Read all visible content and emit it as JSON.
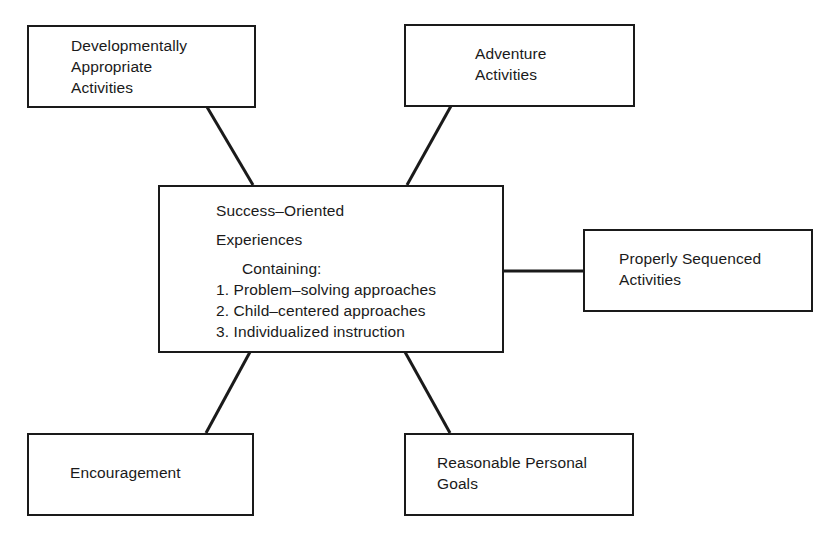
{
  "diagram": {
    "center": {
      "title_line1": "Success–Oriented",
      "title_line2": "Experiences",
      "subtitle": "Containing:",
      "items": [
        "1. Problem–solving approaches",
        "2. Child–centered approaches",
        "3. Individualized instruction"
      ]
    },
    "nodes": {
      "top_left": {
        "lines": [
          "Developmentally",
          "Appropriate",
          "Activities"
        ]
      },
      "top_right": {
        "lines": [
          "Adventure",
          "Activities"
        ]
      },
      "right": {
        "lines": [
          "Properly Sequenced",
          "Activities"
        ]
      },
      "bottom_left": {
        "lines": [
          "Encouragement"
        ]
      },
      "bottom_right": {
        "lines": [
          "Reasonable Personal",
          "Goals"
        ]
      }
    },
    "colors": {
      "stroke": "#1a1a1a",
      "background": "#ffffff"
    }
  }
}
